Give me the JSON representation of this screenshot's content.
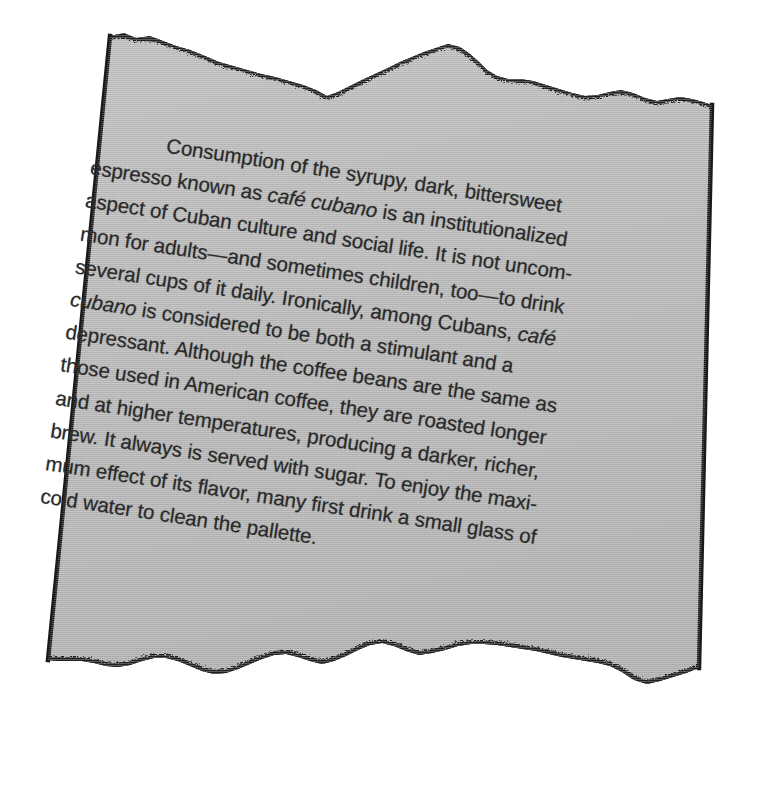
{
  "document": {
    "kind": "torn-paper-scrap",
    "background_color": "#ffffff",
    "paper_color": "#b5b5b5",
    "paper_edge_color": "#1f1f1f",
    "text_color": "#2b2b2b",
    "rotation_degrees": 8.6,
    "title": "Café Cubano passage on torn paper",
    "full_text": "Consumption of the syrupy, dark, bittersweet espresso known as café cubano is an institutionalized aspect of Cuban culture and social life. It is not uncommon for adults—and sometimes children, too—to drink several cups of it daily. Ironically, among Cubans, café cubano is considered to be both a stimulant and a depressant. Although the coffee beans are the same as those used in American coffee, they are roasted longer and at higher temperatures, producing a darker, richer, brew. It always is served with sugar. To enjoy the maximum effect of its flavor, many first drink a small glass of cold water to clean the pallette.",
    "lines": [
      {
        "indent": true,
        "parts": [
          {
            "text": "Consumption of the syrupy, dark, bittersweet",
            "italic": false
          }
        ]
      },
      {
        "indent": false,
        "parts": [
          {
            "text": "espresso known as ",
            "italic": false
          },
          {
            "text": "café cubano",
            "italic": true
          },
          {
            "text": " is an institutionalized",
            "italic": false
          }
        ]
      },
      {
        "indent": false,
        "parts": [
          {
            "text": "aspect of Cuban culture and social life. It is not uncom-",
            "italic": false
          }
        ]
      },
      {
        "indent": false,
        "parts": [
          {
            "text": "mon for adults—and sometimes children, too—to drink",
            "italic": false
          }
        ]
      },
      {
        "indent": false,
        "parts": [
          {
            "text": "several cups of it daily. Ironically, among Cubans, ",
            "italic": false
          },
          {
            "text": "café",
            "italic": true
          }
        ]
      },
      {
        "indent": false,
        "parts": [
          {
            "text": "cubano",
            "italic": true
          },
          {
            "text": " is considered to be both a stimulant and a",
            "italic": false
          }
        ]
      },
      {
        "indent": false,
        "parts": [
          {
            "text": "depressant. Although the coffee beans are the same as",
            "italic": false
          }
        ]
      },
      {
        "indent": false,
        "parts": [
          {
            "text": "those used in American coffee, they are roasted longer",
            "italic": false
          }
        ]
      },
      {
        "indent": false,
        "parts": [
          {
            "text": "and at higher temperatures, producing a darker, richer,",
            "italic": false
          }
        ]
      },
      {
        "indent": false,
        "parts": [
          {
            "text": "brew. It always is served with sugar. To enjoy the maxi-",
            "italic": false
          }
        ]
      },
      {
        "indent": false,
        "parts": [
          {
            "text": "mum effect of its flavor, many first drink a small glass of",
            "italic": false
          }
        ]
      },
      {
        "indent": false,
        "parts": [
          {
            "text": "cold water to clean the pallette.",
            "italic": false
          }
        ]
      }
    ]
  }
}
